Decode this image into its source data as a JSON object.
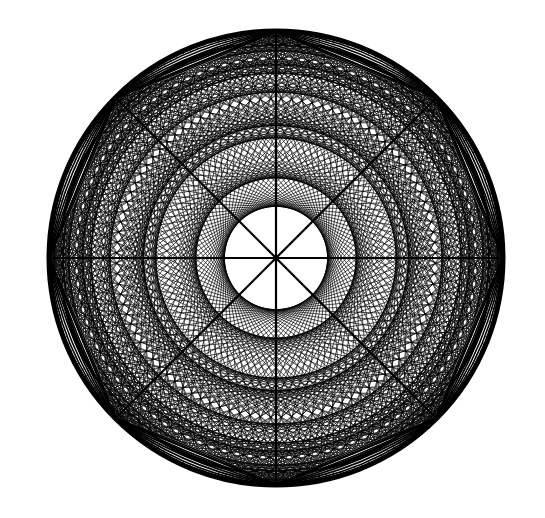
{
  "figure": {
    "canvas": {
      "width": 545,
      "height": 518
    },
    "background": "#ffffff",
    "ink": "#000000",
    "circle": {
      "cx": 276,
      "cy": 258,
      "r": 227,
      "stroke_width": 5
    },
    "octagon": {
      "vertices": 8,
      "rotation_deg": -90,
      "spokes": true,
      "spoke_width": 2.2,
      "edge_width": 2.4
    },
    "lattice": {
      "boundary_points": 96,
      "chord_skips": [
        7,
        11,
        13,
        17,
        19,
        23,
        29,
        31,
        37,
        41
      ],
      "chord_width": 0.9,
      "chord_opacity": 0.75
    },
    "lenses": {
      "count": 8,
      "inner_bulge": 0.62,
      "band_lines": 4,
      "band_spacing": 5,
      "fill": "#000000"
    }
  }
}
